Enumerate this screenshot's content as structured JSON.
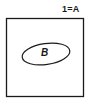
{
  "universe": {
    "label": "1=A",
    "shape": "square",
    "stroke": "#1a1a1a"
  },
  "subset": {
    "label": "B",
    "shape": "ellipse",
    "stroke": "#1a1a1a"
  }
}
